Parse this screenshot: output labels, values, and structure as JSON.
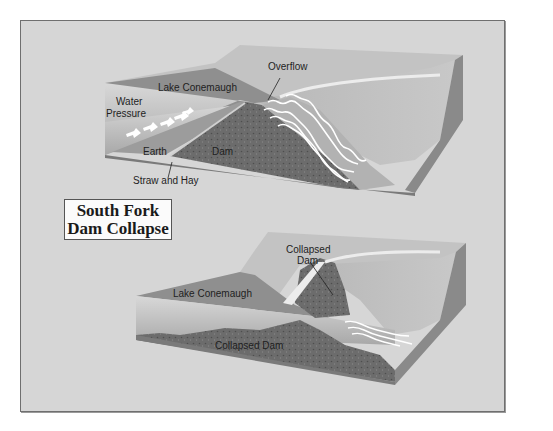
{
  "figure": {
    "title_line1": "South Fork",
    "title_line2": "Dam Collapse",
    "colors": {
      "frame_bg": "#d6d6d6",
      "frame_border": "#6f6f6f",
      "terrain_top": "#c2c2c2",
      "lake": "#8e8e8e",
      "water_face": "#b4b4b4",
      "dam": "#6a6a6a",
      "earth": "#9c9c9c",
      "right_face": "#8a8a8a",
      "water_streaks": "#ffffff"
    }
  },
  "top_panel": {
    "name": "before-collapse",
    "labels": {
      "overflow": "Overflow",
      "lake": "Lake Conemaugh",
      "water_pressure_1": "Water",
      "water_pressure_2": "Pressure",
      "earth": "Earth",
      "dam": "Dam",
      "straw": "Straw and Hay"
    }
  },
  "bottom_panel": {
    "name": "after-collapse",
    "labels": {
      "collapsed_dam_top_1": "Collapsed",
      "collapsed_dam_top_2": "Dam",
      "lake": "Lake Conemaugh",
      "collapsed_dam_bottom": "Collapsed Dam"
    }
  }
}
